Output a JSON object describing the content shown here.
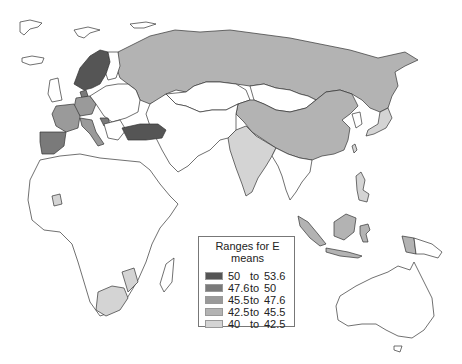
{
  "map": {
    "title": "Ranges for E means",
    "projection": "Eurasia, Africa and Oceania",
    "fills": {
      "none": "#ffffff",
      "c1": "#555555",
      "c2": "#7a7a7a",
      "c3": "#9a9a9a",
      "c4": "#b3b3b3",
      "c5": "#d4d4d4"
    },
    "regions": {
      "norway_sweden": "c1",
      "turkey": "c1",
      "denmark": "c2",
      "germany": "c3",
      "france": "c3",
      "spain_portugal": "c2",
      "italy": "c3",
      "croatia": "c2",
      "russia": "c4",
      "china": "c4",
      "indonesia": "c4",
      "papua_new_guinea": "c4",
      "india": "c5",
      "japan": "c5",
      "south_africa": "c5",
      "mozambique_zimbabwe": "c5",
      "ghana": "c5",
      "philippines": "c5",
      "taiwan": "c5"
    }
  },
  "legend": {
    "title": "Ranges for E means",
    "items": [
      {
        "low": "50",
        "to": "to",
        "high": "53.6",
        "color": "#555555"
      },
      {
        "low": "47.6",
        "to": "to",
        "high": "50",
        "color": "#7a7a7a"
      },
      {
        "low": "45.5",
        "to": "to",
        "high": "47.6",
        "color": "#9a9a9a"
      },
      {
        "low": "42.5",
        "to": "to",
        "high": "45.5",
        "color": "#b3b3b3"
      },
      {
        "low": "40",
        "to": "to",
        "high": "42.5",
        "color": "#d4d4d4"
      }
    ]
  }
}
